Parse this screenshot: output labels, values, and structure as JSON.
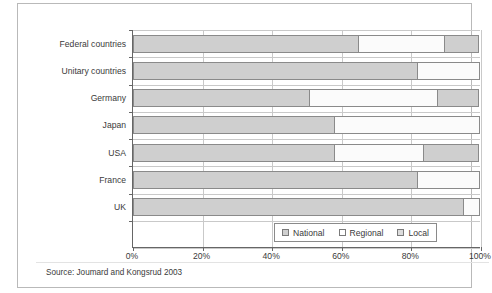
{
  "chart_data": {
    "type": "bar",
    "orientation": "horizontal",
    "stacked": true,
    "normalized_percent": true,
    "title": "",
    "xlabel": "",
    "ylabel": "",
    "xlim": [
      0,
      100
    ],
    "grid": true,
    "legend_position": "inside-bottom-right",
    "categories": [
      "Federal countries",
      "Unitary countries",
      "Germany",
      "Japan",
      "USA",
      "France",
      "UK"
    ],
    "xtick_labels": [
      "0%",
      "20%",
      "40%",
      "60%",
      "80%",
      "100%"
    ],
    "xtick_values": [
      0,
      20,
      40,
      60,
      80,
      100
    ],
    "series": [
      {
        "name": "National",
        "color": "#cfcfcf",
        "values": [
          65,
          82,
          51,
          58,
          58,
          82,
          95
        ]
      },
      {
        "name": "Regional",
        "color": "#fbfbfb",
        "values": [
          25,
          18,
          37,
          42,
          26,
          18,
          5
        ]
      },
      {
        "name": "Local",
        "color": "#cfcfcf",
        "values": [
          10,
          0,
          12,
          0,
          16,
          0,
          0
        ]
      }
    ],
    "source": "Source: Joumard and Kongsrud 2003"
  },
  "legend": {
    "items": [
      {
        "label": "National",
        "swatch": "#cfcfcf"
      },
      {
        "label": "Regional",
        "swatch": "#ffffff"
      },
      {
        "label": "Local",
        "swatch": "#dcdcdc"
      }
    ]
  },
  "figure": {
    "source_note": "Source: Joumard and Kongsrud 2003"
  }
}
